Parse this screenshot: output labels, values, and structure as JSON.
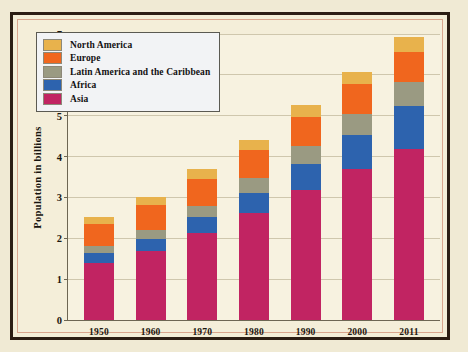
{
  "top_fragment": "",
  "chart_data": {
    "type": "bar",
    "subtype": "stacked-bar",
    "title": "",
    "xlabel": "",
    "ylabel": "Population in billions",
    "ylim": [
      0,
      7
    ],
    "ytick_labels": [
      "0",
      "1",
      "2",
      "3",
      "4",
      "5",
      "6",
      "7"
    ],
    "yticks": [
      0,
      1,
      2,
      3,
      4,
      5,
      6,
      7
    ],
    "grid": true,
    "legend_position": "upper-left-inside",
    "categories": [
      "1950",
      "1960",
      "1970",
      "1980",
      "1990",
      "2000",
      "2011"
    ],
    "stack_order_bottom_to_top": [
      "Asia",
      "Africa",
      "Latin America and the Caribbean",
      "Europe",
      "North America"
    ],
    "series": [
      {
        "name": "Asia",
        "color": "#c12462",
        "values": [
          1.4,
          1.7,
          2.14,
          2.63,
          3.18,
          3.7,
          4.18
        ]
      },
      {
        "name": "Africa",
        "color": "#2d63ae",
        "values": [
          0.23,
          0.28,
          0.37,
          0.48,
          0.64,
          0.82,
          1.05
        ]
      },
      {
        "name": "Latin America and the Caribbean",
        "color": "#9a9a82",
        "values": [
          0.17,
          0.22,
          0.29,
          0.36,
          0.44,
          0.52,
          0.6
        ]
      },
      {
        "name": "Europe",
        "color": "#f0661e",
        "values": [
          0.55,
          0.61,
          0.66,
          0.69,
          0.72,
          0.73,
          0.74
        ]
      },
      {
        "name": "North America",
        "color": "#e8b24c",
        "values": [
          0.17,
          0.2,
          0.23,
          0.25,
          0.28,
          0.31,
          0.35
        ]
      }
    ],
    "totals": [
      2.52,
      3.01,
      3.69,
      4.41,
      5.26,
      6.08,
      6.92
    ]
  },
  "legend": {
    "items": [
      {
        "label": "North America",
        "color": "#e8b24c"
      },
      {
        "label": "Europe",
        "color": "#f0661e"
      },
      {
        "label": "Latin America and the Caribbean",
        "color": "#9a9a82"
      },
      {
        "label": "Africa",
        "color": "#2d63ae"
      },
      {
        "label": "Asia",
        "color": "#c12462"
      }
    ]
  },
  "colors": {
    "page_background": "#f0ead4",
    "plot_background": "#f7f2e0",
    "frame_border": "#2b1d12",
    "frame_inner_border": "#d8a58c",
    "axis": "#6d6653",
    "gridline": "#cfc7ad",
    "text": "#1b1710"
  }
}
